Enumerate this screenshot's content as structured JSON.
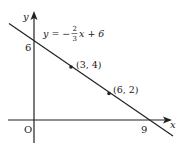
{
  "diagram": {
    "type": "coordinate-graph",
    "axes": {
      "x_label": "x",
      "y_label": "y",
      "origin_label": "O"
    },
    "line": {
      "equation": {
        "lhs": "y = −",
        "frac_num": "2",
        "frac_den": "3",
        "rhs": "x + 6"
      },
      "y_intercept_label": "6",
      "x_intercept_label": "9"
    },
    "points": [
      {
        "label": "(3, 4)",
        "x": 3,
        "y": 4
      },
      {
        "label": "(6, 2)",
        "x": 6,
        "y": 2
      }
    ],
    "colors": {
      "stroke": "#222222",
      "background": "#ffffff"
    }
  }
}
